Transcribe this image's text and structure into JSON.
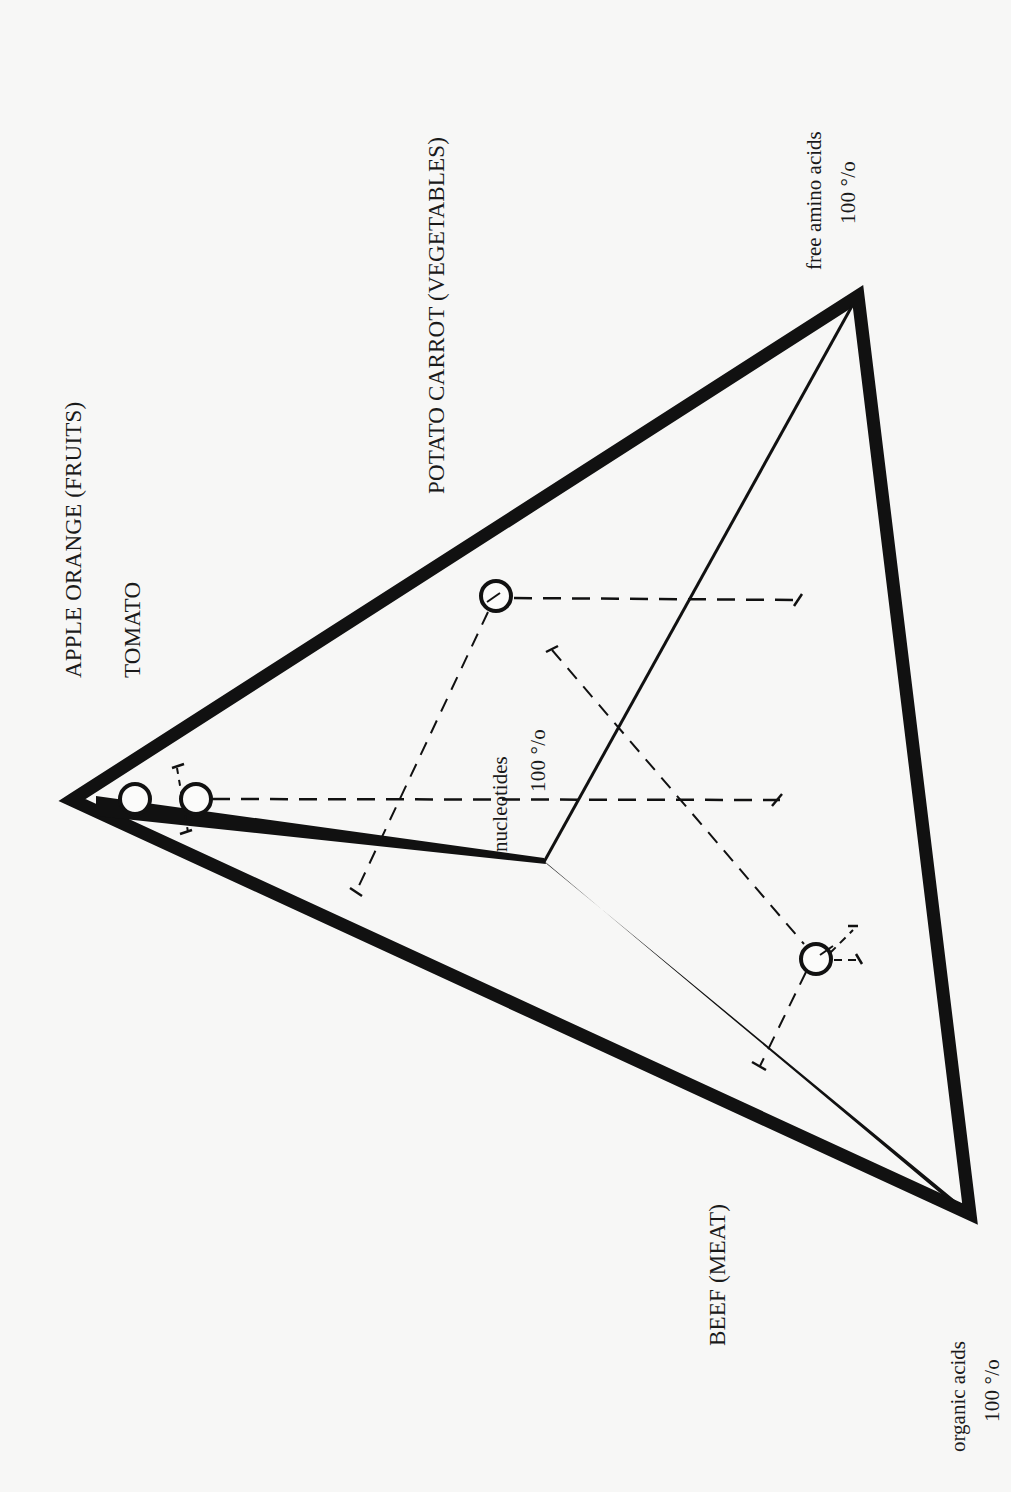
{
  "diagram": {
    "type": "ternary-triangle",
    "orientation": "rotated-90-ccw",
    "colors": {
      "ink": "#111111",
      "paper": "#f7f7f6"
    },
    "vertices": {
      "nucleotides_apex": {
        "label": "nucleotides",
        "pct": "100 %",
        "pct_display": "100 °/o"
      },
      "free_amino_acids": {
        "label": "free amino acids",
        "pct": "100 %",
        "pct_display": "100 °/o"
      },
      "organic_acids": {
        "label": "organic acids",
        "pct": "100 %",
        "pct_display": "100 °/o"
      }
    },
    "groups": {
      "fruits": "APPLE ORANGE  (FRUITS)",
      "tomato": "TOMATO",
      "vegetables": "POTATO  CARROT  (VEGETABLES)",
      "meat": "BEEF  (MEAT)"
    },
    "points": [
      {
        "name": "tomato",
        "group": "TOMATO"
      },
      {
        "name": "apple-orange",
        "group": "APPLE ORANGE (FRUITS)"
      },
      {
        "name": "potato-carrot",
        "group": "POTATO CARROT (VEGETABLES)"
      },
      {
        "name": "beef",
        "group": "BEEF (MEAT)"
      }
    ]
  }
}
